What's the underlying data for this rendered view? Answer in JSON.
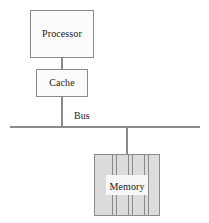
{
  "diagram": {
    "nodes": {
      "processor": {
        "label": "Processor",
        "fill": "#fbfbfb",
        "stroke": "#8a8a8a"
      },
      "cache": {
        "label": "Cache",
        "fill": "#fbfbfb",
        "stroke": "#8a8a8a"
      },
      "memory": {
        "label": "Memory",
        "fill": "#dcdcdc",
        "stroke": "#8a8a8a",
        "stripe_count": 6
      }
    },
    "bus": {
      "label": "Bus",
      "color": "#8a8a8a"
    },
    "connectors": [
      {
        "name": "processor-to-cache",
        "from": "processor",
        "to": "cache"
      },
      {
        "name": "cache-to-bus",
        "from": "cache",
        "to": "bus"
      },
      {
        "name": "bus-to-memory",
        "from": "bus",
        "to": "memory"
      }
    ]
  }
}
